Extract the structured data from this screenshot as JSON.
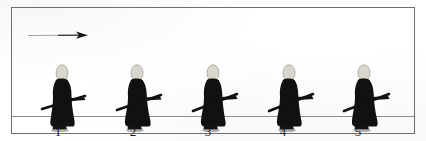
{
  "figure": {
    "background_color": "#ffffff",
    "frame_color": "#6e6e70",
    "ground_line_color": "#8d8d90",
    "silhouette_color": "#111111",
    "head_color": "#d9d6cd",
    "arrow": {
      "icon": "right-arrow-icon",
      "direction": "right",
      "color": "#2a2a2a"
    },
    "walkers": [
      {
        "label": "1",
        "x": 29
      },
      {
        "label": "2",
        "x": 104
      },
      {
        "label": "3",
        "x": 179
      },
      {
        "label": "4",
        "x": 254
      },
      {
        "label": "5",
        "x": 329
      }
    ],
    "labels": [
      {
        "text": "1",
        "x": 42
      },
      {
        "text": "2",
        "x": 117
      },
      {
        "text": "3",
        "x": 192
      },
      {
        "text": "4",
        "x": 267
      },
      {
        "text": "5",
        "x": 342
      }
    ]
  }
}
